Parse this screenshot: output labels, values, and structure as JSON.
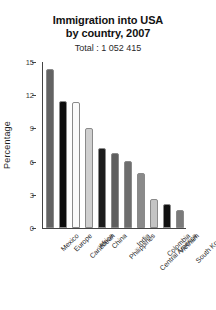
{
  "chart_data": {
    "type": "bar",
    "title": "Immigration into USA\nby country, 2007",
    "title_lines": [
      "Immigration into USA",
      "by country, 2007"
    ],
    "subtitle": "Total : 1 052 415",
    "xlabel": "",
    "ylabel": "Percentage",
    "ylim": [
      0,
      15
    ],
    "yticks": [
      0,
      3,
      6,
      9,
      12,
      15
    ],
    "ytick_labels": [
      "0",
      "3",
      "6",
      "9",
      "12",
      "15"
    ],
    "grid": false,
    "legend": false,
    "categories": [
      "Mexico",
      "Europe",
      "Caribbean",
      "Africa",
      "China",
      "Philippines",
      "India",
      "Central America",
      "Colombia",
      "Vietnam",
      "South Korea"
    ],
    "values": [
      14.4,
      11.5,
      11.4,
      9.0,
      7.2,
      6.8,
      6.1,
      5.0,
      2.6,
      2.2,
      1.6
    ],
    "bar_colors": [
      "#636363",
      "#0d0d0d",
      "#fbfbfb",
      "#cfcfcf",
      "#1c1c1c",
      "#5e5e5e",
      "#6e6e6e",
      "#8a8a8a",
      "#c4c4c4",
      "#111111",
      "#7a7a7a"
    ]
  }
}
